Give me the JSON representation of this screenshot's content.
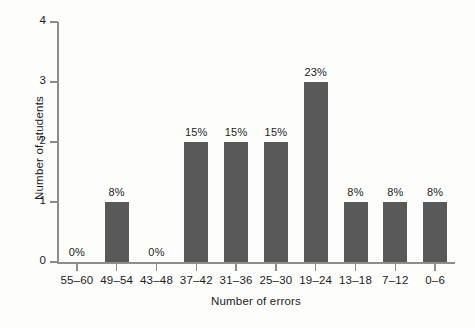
{
  "chart_data": {
    "type": "bar",
    "title": "",
    "xlabel": "Number of errors",
    "ylabel": "Number of students",
    "categories": [
      "55–60",
      "49–54",
      "43–48",
      "37–42",
      "31–36",
      "25–30",
      "19–24",
      "13–18",
      "7–12",
      "0–6"
    ],
    "values": [
      0,
      1,
      0,
      2,
      2,
      2,
      3,
      1,
      1,
      1
    ],
    "data_labels": [
      "0%",
      "8%",
      "0%",
      "15%",
      "15%",
      "15%",
      "23%",
      "8%",
      "8%",
      "8%"
    ],
    "ylim": [
      0,
      4
    ],
    "yticks": [
      0,
      1,
      2,
      3,
      4
    ],
    "ytick_labels": [
      "0",
      "1",
      "2",
      "3",
      "4"
    ],
    "grid": false,
    "legend": false,
    "bar_color": "#595959",
    "axis_color": "#8d8d8d",
    "text_color": "#1c1c1c",
    "background": "#fdfdfc"
  }
}
